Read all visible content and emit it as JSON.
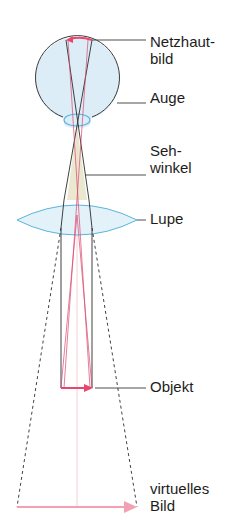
{
  "labels": {
    "retina_image_line1": "Netzhaut-",
    "retina_image_line2": "bild",
    "eye": "Auge",
    "visual_angle_line1": "Seh-",
    "visual_angle_line2": "winkel",
    "magnifier": "Lupe",
    "object": "Objekt",
    "virtual_image_line1": "virtuelles",
    "virtual_image_line2": "Bild"
  },
  "colors": {
    "eye_fill": "#dcedf7",
    "eye_outline": "#3a3a3a",
    "lens_outline": "#5ab4dc",
    "lens_fill": "#e3f2f9",
    "ray_dark": "#2b2b2b",
    "ray_red": "#d9466f",
    "arrow_object": "#e8456f",
    "arrow_virtual": "#f3a0b4",
    "visual_angle_fill": "#e6e2c4",
    "axis": "#f2c4d0",
    "text": "#1d1d1b"
  }
}
